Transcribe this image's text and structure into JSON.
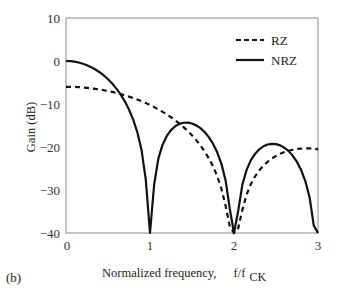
{
  "panel_label": "(b)",
  "chart_data": {
    "type": "line",
    "title": "",
    "xlabel": "Normalized frequency,",
    "xlabel_unit_main": "f/f",
    "xlabel_unit_sub": "CK",
    "ylabel": "Gain (dB)",
    "xlim": [
      0,
      3
    ],
    "ylim": [
      -40,
      10
    ],
    "xticks": [
      0,
      1,
      2,
      3
    ],
    "xtick_labels": [
      "0",
      "1",
      "2",
      "3"
    ],
    "yticks": [
      10,
      0,
      -10,
      -20,
      -30,
      -40
    ],
    "ytick_labels": [
      "10",
      "0",
      "−10",
      "−20",
      "−30",
      "−40"
    ],
    "grid": false,
    "legend_position": "upper right",
    "x": [
      0,
      0.05,
      0.1,
      0.15,
      0.2,
      0.25,
      0.3,
      0.35,
      0.4,
      0.45,
      0.5,
      0.55,
      0.6,
      0.65,
      0.7,
      0.75,
      0.8,
      0.85,
      0.9,
      0.95,
      1.0,
      1.05,
      1.1,
      1.15,
      1.2,
      1.25,
      1.3,
      1.35,
      1.4,
      1.45,
      1.5,
      1.55,
      1.6,
      1.65,
      1.7,
      1.75,
      1.8,
      1.85,
      1.9,
      1.95,
      2.0,
      2.05,
      2.1,
      2.15,
      2.2,
      2.25,
      2.3,
      2.35,
      2.4,
      2.45,
      2.5,
      2.55,
      2.6,
      2.65,
      2.7,
      2.75,
      2.8,
      2.85,
      2.9,
      2.95,
      3.0
    ],
    "series": [
      {
        "name": "RZ",
        "style": "dashed",
        "color": "#111111",
        "values": [
          -6.0,
          -6.01,
          -6.04,
          -6.09,
          -6.15,
          -6.24,
          -6.35,
          -6.48,
          -6.63,
          -6.8,
          -6.98,
          -7.19,
          -7.43,
          -7.69,
          -7.97,
          -8.28,
          -8.61,
          -8.97,
          -9.36,
          -9.78,
          -10.24,
          -10.73,
          -11.25,
          -11.82,
          -12.42,
          -13.08,
          -13.78,
          -14.55,
          -15.38,
          -16.29,
          -17.29,
          -18.4,
          -19.63,
          -21.03,
          -22.62,
          -24.48,
          -26.77,
          -29.7,
          -33.66,
          -38.5,
          -40.0,
          -38.9,
          -34.6,
          -31.1,
          -28.65,
          -26.85,
          -25.46,
          -24.33,
          -23.43,
          -22.69,
          -22.08,
          -21.58,
          -21.18,
          -20.86,
          -20.63,
          -20.46,
          -20.36,
          -20.32,
          -20.34,
          -20.41,
          -20.54
        ]
      },
      {
        "name": "NRZ",
        "style": "solid",
        "color": "#111111",
        "values": [
          0.0,
          -0.04,
          -0.15,
          -0.35,
          -0.63,
          -0.98,
          -1.43,
          -1.97,
          -2.61,
          -3.36,
          -4.24,
          -5.25,
          -6.42,
          -7.78,
          -9.38,
          -11.29,
          -13.63,
          -16.62,
          -20.77,
          -27.66,
          -40.0,
          -28.6,
          -22.65,
          -19.46,
          -17.43,
          -16.08,
          -15.18,
          -14.63,
          -14.36,
          -14.34,
          -14.54,
          -14.97,
          -15.62,
          -16.51,
          -17.7,
          -19.23,
          -21.23,
          -23.92,
          -27.78,
          -34.41,
          -40.0,
          -34.87,
          -28.72,
          -25.33,
          -23.12,
          -21.6,
          -20.54,
          -19.84,
          -19.42,
          -19.26,
          -19.33,
          -19.63,
          -20.17,
          -20.96,
          -22.04,
          -23.48,
          -25.38,
          -27.97,
          -31.74,
          -38.29,
          -40.0
        ]
      }
    ]
  }
}
